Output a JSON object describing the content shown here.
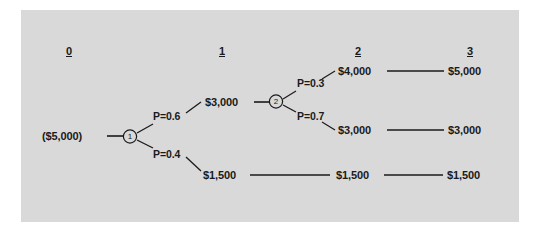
{
  "diagram": {
    "type": "decision-tree",
    "title": "",
    "panel_color": "#d9d9d9",
    "line_color": "#1a1a1a",
    "text_color": "#1a1a1a",
    "headers": [
      {
        "label": "0"
      },
      {
        "label": "1"
      },
      {
        "label": "2"
      },
      {
        "label": "3"
      }
    ],
    "root": {
      "label": "($5,000)"
    },
    "nodes": [
      {
        "id": "node-1",
        "label": "1"
      },
      {
        "id": "node-2",
        "label": "2"
      }
    ],
    "probabilities": [
      {
        "id": "p-upper-1",
        "label": "P=0.6"
      },
      {
        "id": "p-lower-1",
        "label": "P=0.4"
      },
      {
        "id": "p-upper-2",
        "label": "P=0.3"
      },
      {
        "id": "p-lower-2",
        "label": "P=0.7"
      }
    ],
    "values": {
      "stage1_upper": "$3,000",
      "stage1_lower": "$1,500",
      "stage2_top": "$4,000",
      "stage2_middle": "$3,000",
      "stage2_bottom": "$1,500",
      "stage3_top": "$5,000",
      "stage3_middle": "$3,000",
      "stage3_bottom": "$1,500"
    }
  }
}
